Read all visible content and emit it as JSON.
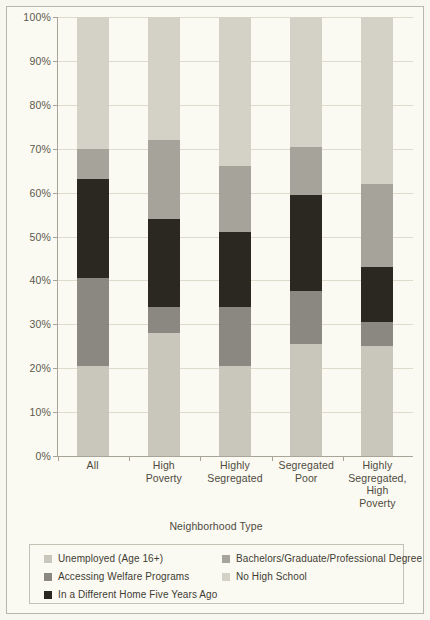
{
  "chart_data": {
    "type": "bar",
    "title": "",
    "subtitle": "",
    "xlabel": "Neighborhood Type",
    "ylabel": "",
    "stacked": true,
    "normalized_percent": true,
    "grid": true,
    "legend_position": "bottom",
    "ylim": [
      0,
      100
    ],
    "y_ticks": [
      "0%",
      "10%",
      "20%",
      "30%",
      "40%",
      "50%",
      "60%",
      "70%",
      "80%",
      "90%",
      "100%"
    ],
    "y_tick_values": [
      0,
      10,
      20,
      30,
      40,
      50,
      60,
      70,
      80,
      90,
      100
    ],
    "categories": [
      "All",
      "High Poverty",
      "Highly Segregated",
      "Segregated Poor",
      "Highly Segregated, High Poverty"
    ],
    "category_label_lines": [
      [
        "All"
      ],
      [
        "High",
        "Poverty"
      ],
      [
        "Highly",
        "Segregated"
      ],
      [
        "Segregated",
        "Poor"
      ],
      [
        "Highly",
        "Segregated,",
        "High",
        "Poverty"
      ]
    ],
    "series": [
      {
        "name": "Unemployed (Age 16+)",
        "color": "#c9c7bb",
        "values": [
          20.5,
          28.0,
          20.5,
          25.5,
          25.0
        ]
      },
      {
        "name": "Accessing Welfare Programs",
        "color": "#8a8880",
        "values": [
          20.0,
          6.0,
          13.5,
          12.0,
          5.5
        ]
      },
      {
        "name": "In a Different Home Five Years Ago",
        "color": "#2b2821",
        "values": [
          22.5,
          20.0,
          17.0,
          22.0,
          12.5
        ]
      },
      {
        "name": "Bachelors/Graduate/Professional Degree",
        "color": "#a6a49a",
        "values": [
          7.0,
          18.0,
          15.0,
          11.0,
          19.0
        ]
      },
      {
        "name": "No High School",
        "color": "#d4d2c7",
        "values": [
          30.0,
          28.0,
          34.0,
          29.5,
          38.0
        ]
      }
    ],
    "cumulative_tops": [
      [
        20.5,
        40.5,
        63.0,
        70.0,
        100.0
      ],
      [
        28.0,
        34.0,
        54.0,
        72.0,
        100.0
      ],
      [
        20.5,
        34.0,
        51.0,
        66.0,
        100.0
      ],
      [
        25.5,
        37.5,
        59.5,
        70.5,
        100.0
      ],
      [
        25.0,
        30.5,
        43.0,
        62.0,
        100.0
      ]
    ]
  },
  "legend": {
    "entries": [
      {
        "label": "Unemployed (Age 16+)",
        "color": "#c9c7bb"
      },
      {
        "label": "Accessing Welfare Programs",
        "color": "#8a8880"
      },
      {
        "label": "In a Different Home Five Years Ago",
        "color": "#2b2821"
      },
      {
        "label": "Bachelors/Graduate/Professional Degree",
        "color": "#a6a49a"
      },
      {
        "label": "No High School",
        "color": "#d4d2c7"
      }
    ]
  },
  "colors": {
    "background": "#faf9f2",
    "frame_border": "#b9b7ac",
    "gridline": "#dedbcd",
    "axis": "#a8a598",
    "text": "#4e4b40"
  }
}
